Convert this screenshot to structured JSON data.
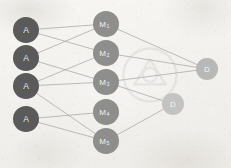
{
  "diagram": {
    "width": 231,
    "height": 168,
    "background_color": "#f2f1ee"
  },
  "colors": {
    "input_node_fill": "#5a5a5a",
    "input_node_text": "#e8e8e6",
    "hidden_node_fill": "#8e8e8c",
    "hidden_node_text": "#f0f0ee",
    "output_node_fill_primary": "#b8b8b6",
    "output_node_fill_secondary": "#c3c3c1",
    "output_node_text": "#f4f4f2",
    "edge_color": "#a8a8a5"
  },
  "layers": [
    {
      "name": "input-layer",
      "nodes": [
        {
          "id": "A1",
          "label": "A",
          "sub": "",
          "cx": 26,
          "cy": 30,
          "r": 13
        },
        {
          "id": "A2",
          "label": "A",
          "sub": "",
          "cx": 26,
          "cy": 58,
          "r": 13
        },
        {
          "id": "A3",
          "label": "A",
          "sub": "",
          "cx": 26,
          "cy": 86,
          "r": 13
        },
        {
          "id": "A4",
          "label": "A",
          "sub": "",
          "cx": 26,
          "cy": 119,
          "r": 13
        }
      ]
    },
    {
      "name": "hidden-layer",
      "nodes": [
        {
          "id": "M1",
          "label": "M",
          "sub": "1",
          "cx": 106,
          "cy": 24,
          "r": 13
        },
        {
          "id": "M2",
          "label": "M",
          "sub": "2",
          "cx": 106,
          "cy": 53,
          "r": 13
        },
        {
          "id": "M3",
          "label": "M",
          "sub": "3",
          "cx": 106,
          "cy": 82,
          "r": 13
        },
        {
          "id": "M4",
          "label": "M",
          "sub": "4",
          "cx": 106,
          "cy": 112,
          "r": 13
        },
        {
          "id": "M5",
          "label": "M",
          "sub": "5",
          "cx": 106,
          "cy": 141,
          "r": 13
        }
      ]
    },
    {
      "name": "output-layer",
      "nodes": [
        {
          "id": "D1",
          "label": "D",
          "sub": "",
          "cx": 207,
          "cy": 69,
          "r": 11
        },
        {
          "id": "D2",
          "label": "D",
          "sub": "",
          "cx": 173,
          "cy": 104,
          "r": 11
        }
      ]
    }
  ],
  "edges": [
    {
      "from": "A1",
      "to": "M1"
    },
    {
      "from": "A1",
      "to": "M2"
    },
    {
      "from": "A2",
      "to": "M1"
    },
    {
      "from": "A2",
      "to": "M3"
    },
    {
      "from": "A3",
      "to": "M2"
    },
    {
      "from": "A3",
      "to": "M3"
    },
    {
      "from": "A3",
      "to": "M5"
    },
    {
      "from": "A4",
      "to": "M4"
    },
    {
      "from": "A4",
      "to": "M5"
    },
    {
      "from": "M1",
      "to": "D1"
    },
    {
      "from": "M2",
      "to": "D1"
    },
    {
      "from": "M3",
      "to": "D1"
    },
    {
      "from": "M3",
      "to": "D2"
    },
    {
      "from": "M5",
      "to": "D2"
    }
  ]
}
